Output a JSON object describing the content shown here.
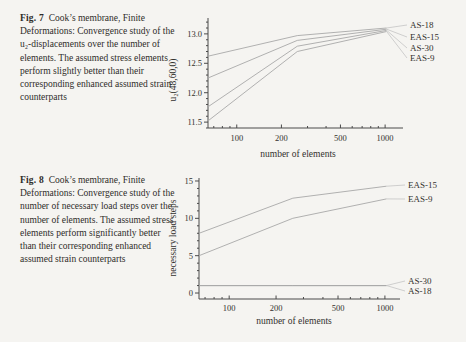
{
  "page": {
    "background": "#f5f4f1",
    "text_color": "#2e2c29",
    "curve_color": "#a8a8a8",
    "leader_color": "#c4c4c4",
    "axis_color": "#4a4a4a"
  },
  "figures": [
    {
      "caption_label": "Fig. 7",
      "caption_text": "Cook’s membrane, Finite Deformations: Convergence study of the u₂-displacements over the number of elements. The assumed stress elements perform slightly better than their corresponding enhanced assumed strain counterparts"
    },
    {
      "caption_label": "Fig. 8",
      "caption_text": "Cook’s membrane, Finite Deformations: Convergence study of the number of necessary load steps over the number of elements. The assumed stress elements perform significantly better than their corresponding enhanced assumed strain counterparts"
    }
  ],
  "chart_data": [
    {
      "type": "line",
      "title": "",
      "xlabel": "number of elements",
      "ylabel": "u₂(48,60,0)",
      "xscale": "log",
      "grid": false,
      "legend_position": "right",
      "x": [
        64,
        256,
        1024
      ],
      "series": [
        {
          "name": "AS-18",
          "values": [
            12.62,
            12.97,
            13.1
          ]
        },
        {
          "name": "EAS-15",
          "values": [
            12.25,
            12.89,
            13.08
          ]
        },
        {
          "name": "AS-30",
          "values": [
            11.76,
            12.79,
            13.06
          ]
        },
        {
          "name": "EAS-9",
          "values": [
            11.52,
            12.7,
            13.04
          ]
        }
      ],
      "xticks": [
        100,
        200,
        500,
        1000
      ],
      "xtick_labels": [
        "100",
        "200",
        "500",
        "1000"
      ],
      "yticks": [
        11.5,
        12.0,
        12.5,
        13.0
      ],
      "ytick_labels": [
        "11.5",
        "12.0",
        "12.5",
        "13.0"
      ],
      "xlim": [
        64,
        1320
      ],
      "ylim": [
        11.4,
        13.27
      ],
      "y_minor_step": 0.1
    },
    {
      "type": "line",
      "title": "",
      "xlabel": "number of elements",
      "ylabel": "necessary load steps",
      "xscale": "log",
      "grid": false,
      "legend_position": "right",
      "x": [
        64,
        256,
        1024
      ],
      "series": [
        {
          "name": "EAS-15",
          "values": [
            8,
            12.7,
            14.3
          ]
        },
        {
          "name": "EAS-9",
          "values": [
            5,
            10,
            12.6
          ]
        },
        {
          "name": "AS-30",
          "values": [
            1,
            1,
            1
          ]
        },
        {
          "name": "AS-18",
          "values": [
            1,
            1,
            1
          ]
        }
      ],
      "xticks": [
        100,
        200,
        500,
        1000
      ],
      "xtick_labels": [
        "100",
        "200",
        "500",
        "1000"
      ],
      "yticks": [
        0,
        5,
        10,
        15
      ],
      "ytick_labels": [
        "0",
        "5",
        "10",
        "15"
      ],
      "xlim": [
        64,
        1250
      ],
      "ylim": [
        -0.8,
        15.4
      ],
      "y_minor_step": 1
    }
  ]
}
